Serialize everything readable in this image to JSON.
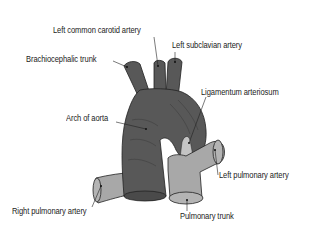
{
  "diagram": {
    "labels": {
      "left_common_carotid": "Left common carotid artery",
      "left_subclavian": "Left subclavian artery",
      "brachiocephalic": "Brachiocephalic trunk",
      "ligamentum": "Ligamentum arteriosum",
      "arch_of_aorta": "Arch of aorta",
      "left_pulmonary": "Left pulmonary artery",
      "right_pulmonary": "Right pulmonary artery",
      "pulmonary_trunk": "Pulmonary trunk"
    },
    "colors": {
      "aorta": "#585858",
      "pulmonary": "#a8a8a8",
      "ligamentum": "#c4c4c4",
      "outline": "#222222",
      "text": "#222222"
    }
  }
}
